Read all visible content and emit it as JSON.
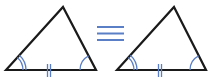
{
  "diagram": {
    "relation_symbol": "≡",
    "colors": {
      "edge": "#1a1a1a",
      "mark": "#5b7fc7",
      "background": "#ffffff"
    },
    "triangles": [
      {
        "name": "triangle-left",
        "vertices": [
          [
            6,
            70
          ],
          [
            63,
            7
          ],
          [
            96,
            70
          ]
        ],
        "base_tick_marks": 2,
        "left_angle_arcs": 2,
        "right_angle_arcs": 1
      },
      {
        "name": "triangle-right",
        "vertices": [
          [
            117,
            70
          ],
          [
            174,
            7
          ],
          [
            206,
            70
          ]
        ],
        "base_tick_marks": 2,
        "left_angle_arcs": 2,
        "right_angle_arcs": 1
      }
    ]
  }
}
